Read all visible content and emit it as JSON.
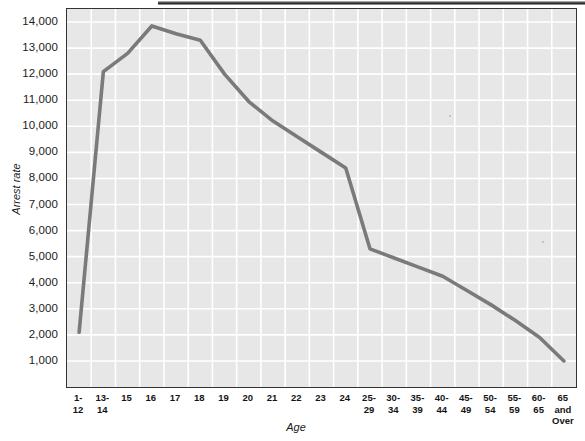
{
  "figure": {
    "name": "arrest-rate-by-age-line-chart",
    "background_color": "#ffffff",
    "plot_background_color": "#e7e7e7",
    "grid_color": "#ffffff",
    "line_color": "#7a7a7a",
    "frame_color": "#333333"
  },
  "axes": {
    "y_title": "Arrest rate",
    "x_title": "Age",
    "y_ticks": [
      "1,000",
      "2,000",
      "3,000",
      "4,000",
      "5,000",
      "6,000",
      "7,000",
      "8,000",
      "9,000",
      "10,000",
      "11,000",
      "12,000",
      "13,000",
      "14,000"
    ],
    "x_ticks": [
      "1-\n12",
      "13-\n14",
      "15",
      "16",
      "17",
      "18",
      "19",
      "20",
      "21",
      "22",
      "23",
      "24",
      "25-\n29",
      "30-\n34",
      "35-\n39",
      "40-\n44",
      "45-\n49",
      "50-\n54",
      "55-\n59",
      "60-\n65",
      "65 and\nOver"
    ]
  },
  "chart_data": {
    "type": "line",
    "title": "",
    "xlabel": "Age",
    "ylabel": "Arrest rate",
    "categories": [
      "1-12",
      "13-14",
      "15",
      "16",
      "17",
      "18",
      "19",
      "20",
      "21",
      "22",
      "23",
      "24",
      "25-29",
      "30-34",
      "35-39",
      "40-44",
      "45-49",
      "50-54",
      "55-59",
      "60-65",
      "65 and Over"
    ],
    "values": [
      2100,
      12100,
      12800,
      13850,
      13550,
      13300,
      12000,
      10950,
      10200,
      9600,
      9000,
      8400,
      5300,
      4950,
      4600,
      4250,
      3700,
      3150,
      2550,
      1900,
      1000
    ],
    "ylim": [
      0,
      14500
    ],
    "ytick_values": [
      1000,
      2000,
      3000,
      4000,
      5000,
      6000,
      7000,
      8000,
      9000,
      10000,
      11000,
      12000,
      13000,
      14000
    ],
    "grid": true,
    "legend": "none",
    "series": [
      {
        "name": "Arrest rate",
        "values": [
          2100,
          12100,
          12800,
          13850,
          13550,
          13300,
          12000,
          10950,
          10200,
          9600,
          9000,
          8400,
          5300,
          4950,
          4600,
          4250,
          3700,
          3150,
          2550,
          1900,
          1000
        ]
      }
    ]
  }
}
